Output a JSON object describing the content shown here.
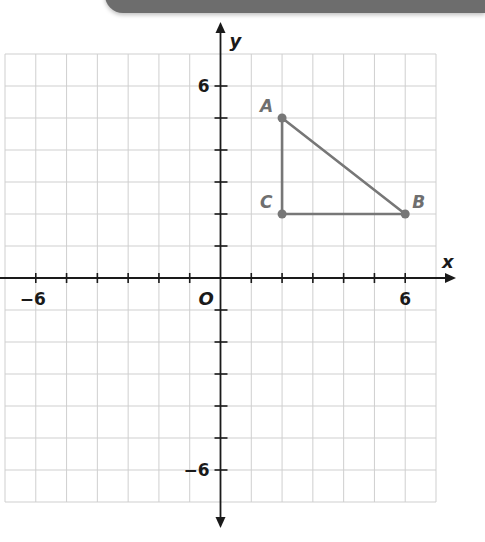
{
  "chart_data": {
    "type": "scatter",
    "title": "",
    "xlabel": "x",
    "ylabel": "y",
    "xlim": [
      -7,
      7
    ],
    "ylim": [
      -7,
      7
    ],
    "grid": true,
    "origin_label": "O",
    "x_tick_labels": [
      {
        "value": -6,
        "label": "−6"
      },
      {
        "value": 6,
        "label": "6"
      }
    ],
    "y_tick_labels": [
      {
        "value": 6,
        "label": "6"
      },
      {
        "value": -6,
        "label": "−6"
      }
    ],
    "points": [
      {
        "name": "A",
        "x": 2,
        "y": 5
      },
      {
        "name": "B",
        "x": 6,
        "y": 2
      },
      {
        "name": "C",
        "x": 2,
        "y": 2
      }
    ],
    "polygon": {
      "name": "triangle ABC",
      "vertices": [
        "A",
        "B",
        "C"
      ]
    },
    "colors": {
      "shape": "#777777",
      "axes": "#1a1a1a",
      "grid": "#cfcfcf",
      "banner": "#6d6d6d"
    }
  }
}
